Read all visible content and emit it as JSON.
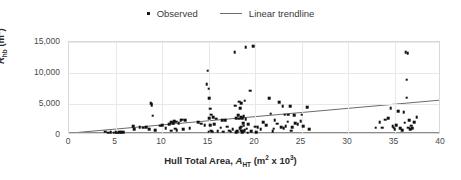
{
  "legend": {
    "position": "top-center",
    "items": [
      {
        "label": "Observed",
        "marker": "square-dot-icon",
        "color": "#111111"
      },
      {
        "label": "Linear trendline",
        "marker": "line-segment-icon",
        "color": "#6b6b6b"
      }
    ]
  },
  "axes": {
    "x": {
      "title_plain": "Hull Total Area, A_HT (m2 x 10^3)",
      "title_prefix": "Hull Total Area, ",
      "title_symbol": "A",
      "title_sub": "HT",
      "title_unit_open": " (m",
      "title_unit_sup1": "2",
      "title_unit_mid": " x 10",
      "title_unit_sup2": "3",
      "title_unit_close": ")",
      "ticks": [
        0,
        5,
        10,
        15,
        20,
        25,
        30,
        35,
        40
      ],
      "tick_labels": [
        "0",
        "5",
        "10",
        "15",
        "20",
        "25",
        "30",
        "35",
        "40"
      ],
      "min": 0,
      "max": 40
    },
    "y": {
      "title_plain": "R_hb (m2)",
      "title_symbol": "R",
      "title_sub": "hb",
      "title_unit_open": " (m",
      "title_unit_sup": "2",
      "title_unit_close": ")",
      "ticks": [
        0,
        5000,
        10000,
        15000
      ],
      "tick_labels": [
        "0",
        "5,000",
        "10,000",
        "15,000"
      ],
      "min": 0,
      "max": 15000
    }
  },
  "colors": {
    "marker": "#111111",
    "trendline": "#6b6b6b",
    "gridline": "#e8e8e8",
    "frame": "#d9d9d9",
    "axis": "#8c8c8c",
    "text": "#3a3a3a",
    "background": "#ffffff"
  },
  "chart_data": {
    "type": "scatter",
    "title": "",
    "xlabel": "Hull Total Area, A_HT (m2 x 10^3)",
    "ylabel": "R_hb (m2)",
    "xlim": [
      0,
      40
    ],
    "ylim": [
      0,
      15000
    ],
    "grid": true,
    "legend_position": "top-center",
    "series": [
      {
        "name": "Observed",
        "type": "scatter",
        "marker": "square",
        "color": "#111111",
        "points": [
          [
            3.9,
            500
          ],
          [
            4.2,
            350
          ],
          [
            4.5,
            420
          ],
          [
            4.8,
            380
          ],
          [
            5.0,
            450
          ],
          [
            5.2,
            400
          ],
          [
            5.4,
            430
          ],
          [
            5.6,
            410
          ],
          [
            5.8,
            460
          ],
          [
            6.9,
            1450
          ],
          [
            7.0,
            900
          ],
          [
            7.6,
            1300
          ],
          [
            8.0,
            1150
          ],
          [
            8.3,
            1250
          ],
          [
            8.6,
            900
          ],
          [
            8.8,
            5150
          ],
          [
            8.9,
            4850
          ],
          [
            8.9,
            5050
          ],
          [
            9.0,
            3100
          ],
          [
            9.3,
            820
          ],
          [
            9.8,
            1500
          ],
          [
            10.0,
            1550
          ],
          [
            10.4,
            1100
          ],
          [
            10.8,
            1700
          ],
          [
            11.0,
            2100
          ],
          [
            11.0,
            700
          ],
          [
            11.2,
            1900
          ],
          [
            11.3,
            2250
          ],
          [
            11.4,
            1000
          ],
          [
            11.5,
            2150
          ],
          [
            11.6,
            780
          ],
          [
            11.8,
            1950
          ],
          [
            12.0,
            2350
          ],
          [
            12.2,
            2500
          ],
          [
            12.3,
            900
          ],
          [
            12.5,
            2400
          ],
          [
            13.0,
            1050
          ],
          [
            13.9,
            2050
          ],
          [
            14.2,
            1800
          ],
          [
            14.6,
            1600
          ],
          [
            14.8,
            8200
          ],
          [
            14.9,
            10350
          ],
          [
            15.0,
            7500
          ],
          [
            15.1,
            5900
          ],
          [
            15.1,
            2750
          ],
          [
            15.2,
            4250
          ],
          [
            15.2,
            1600
          ],
          [
            15.3,
            3250
          ],
          [
            15.3,
            700
          ],
          [
            15.4,
            500
          ],
          [
            15.5,
            2850
          ],
          [
            15.6,
            1700
          ],
          [
            15.8,
            2600
          ],
          [
            16.0,
            620
          ],
          [
            16.3,
            1200
          ],
          [
            16.5,
            2350
          ],
          [
            16.8,
            2400
          ],
          [
            17.0,
            1350
          ],
          [
            17.2,
            700
          ],
          [
            17.4,
            560
          ],
          [
            17.6,
            900
          ],
          [
            17.8,
            13400
          ],
          [
            17.9,
            4700
          ],
          [
            18.0,
            2700
          ],
          [
            18.1,
            620
          ],
          [
            18.2,
            3150
          ],
          [
            18.3,
            5400
          ],
          [
            18.3,
            2600
          ],
          [
            18.4,
            4350
          ],
          [
            18.4,
            1100
          ],
          [
            18.5,
            5100
          ],
          [
            18.5,
            2900
          ],
          [
            18.5,
            1350
          ],
          [
            18.5,
            700
          ],
          [
            18.6,
            2750
          ],
          [
            18.6,
            450
          ],
          [
            18.7,
            1900
          ],
          [
            18.7,
            600
          ],
          [
            18.8,
            3000
          ],
          [
            18.8,
            1500
          ],
          [
            18.9,
            5550
          ],
          [
            18.9,
            800
          ],
          [
            19.0,
            14150
          ],
          [
            19.0,
            2550
          ],
          [
            19.1,
            1000
          ],
          [
            19.3,
            1700
          ],
          [
            19.5,
            7150
          ],
          [
            19.6,
            600
          ],
          [
            19.8,
            14300
          ],
          [
            20.0,
            1350
          ],
          [
            20.3,
            1250
          ],
          [
            20.6,
            900
          ],
          [
            20.9,
            2050
          ],
          [
            21.2,
            1600
          ],
          [
            21.5,
            5950
          ],
          [
            21.7,
            3450
          ],
          [
            21.9,
            620
          ],
          [
            22.1,
            2400
          ],
          [
            22.4,
            1800
          ],
          [
            22.6,
            5250
          ],
          [
            22.8,
            1250
          ],
          [
            23.0,
            4600
          ],
          [
            23.2,
            3300
          ],
          [
            23.3,
            1400
          ],
          [
            23.5,
            2150
          ],
          [
            23.6,
            3250
          ],
          [
            23.8,
            4600
          ],
          [
            23.9,
            700
          ],
          [
            24.0,
            1300
          ],
          [
            24.3,
            1950
          ],
          [
            24.6,
            1700
          ],
          [
            24.9,
            2250
          ],
          [
            25.2,
            1450
          ],
          [
            25.6,
            4500
          ],
          [
            25.8,
            900
          ],
          [
            33.0,
            1150
          ],
          [
            33.4,
            2100
          ],
          [
            33.7,
            1200
          ],
          [
            34.0,
            2500
          ],
          [
            34.3,
            2750
          ],
          [
            34.6,
            4300
          ],
          [
            34.8,
            1400
          ],
          [
            34.9,
            1150
          ],
          [
            35.0,
            900
          ],
          [
            35.2,
            1550
          ],
          [
            35.4,
            3800
          ],
          [
            35.6,
            1100
          ],
          [
            35.8,
            800
          ],
          [
            36.0,
            3700
          ],
          [
            36.1,
            2000
          ],
          [
            36.2,
            13400
          ],
          [
            36.3,
            8900
          ],
          [
            36.3,
            6000
          ],
          [
            36.4,
            13150
          ],
          [
            36.5,
            1200
          ],
          [
            36.6,
            2400
          ],
          [
            36.7,
            900
          ],
          [
            36.8,
            1500
          ],
          [
            36.9,
            1050
          ],
          [
            37.1,
            2100
          ],
          [
            37.4,
            2900
          ],
          [
            25.0,
            3300
          ],
          [
            24.2,
            3150
          ],
          [
            23.1,
            1050
          ],
          [
            22.0,
            1000
          ],
          [
            20.1,
            450
          ],
          [
            19.2,
            380
          ],
          [
            18.0,
            420
          ],
          [
            16.6,
            500
          ],
          [
            15.0,
            560
          ]
        ]
      },
      {
        "name": "Linear trendline",
        "type": "line",
        "color": "#6b6b6b",
        "x_start": 1.0,
        "y_start": 100,
        "x_end": 40.0,
        "y_end": 5400
      }
    ]
  }
}
